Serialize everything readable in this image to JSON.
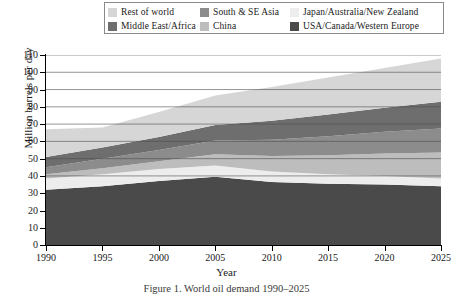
{
  "legend": {
    "entries": [
      {
        "label": "Rest of world",
        "color": "#d6d6d6",
        "row": 0,
        "col": 0
      },
      {
        "label": "South & SE Asia",
        "color": "#8c8c8c",
        "row": 0,
        "col": 1
      },
      {
        "label": "Japan/Australia/New Zealand",
        "color": "#ededed",
        "row": 0,
        "col": 2
      },
      {
        "label": "Middle East/Africa",
        "color": "#6e6e6e",
        "row": 1,
        "col": 0
      },
      {
        "label": "China",
        "color": "#bdbdbd",
        "row": 1,
        "col": 1
      },
      {
        "label": "USA/Canada/Western Europe",
        "color": "#4a4a4a",
        "row": 1,
        "col": 2
      }
    ]
  },
  "axes": {
    "y_title": "Million barrels per day",
    "x_title": "Year",
    "y_ticks": [
      "0",
      "10",
      "20",
      "30",
      "40",
      "50",
      "60",
      "70",
      "80",
      "90",
      "100",
      "110"
    ],
    "x_ticks": [
      "1990",
      "1995",
      "2000",
      "2005",
      "2010",
      "2015",
      "2020",
      "2025"
    ]
  },
  "caption": "Figure 1. World oil demand 1990–2025",
  "chart_data": {
    "type": "area",
    "title": "",
    "xlabel": "Year",
    "ylabel": "Million barrels per day",
    "xlim": [
      1990,
      2025
    ],
    "ylim": [
      0,
      110
    ],
    "ytick_step": 10,
    "grid": true,
    "grid_axis": "y",
    "legend_position": "top",
    "stacked": true,
    "stack_order_bottom_to_top": [
      "USA/Canada/Western Europe",
      "Japan/Australia/New Zealand",
      "China",
      "South & SE Asia",
      "Middle East/Africa",
      "Rest of world"
    ],
    "x": [
      1990,
      1995,
      2000,
      2005,
      2010,
      2015,
      2020,
      2025
    ],
    "series": [
      {
        "name": "USA/Canada/Western Europe",
        "color": "#4a4a4a",
        "values": [
          32.0,
          34.0,
          37.0,
          39.5,
          36.5,
          35.5,
          35.0,
          34.0
        ]
      },
      {
        "name": "Japan/Australia/New Zealand",
        "color": "#ededed",
        "values": [
          6.5,
          7.0,
          7.0,
          6.5,
          6.0,
          5.5,
          5.0,
          4.5
        ]
      },
      {
        "name": "China",
        "color": "#bdbdbd",
        "values": [
          2.5,
          3.5,
          4.5,
          6.5,
          9.0,
          11.0,
          13.0,
          15.0
        ]
      },
      {
        "name": "South & SE Asia",
        "color": "#8c8c8c",
        "values": [
          4.0,
          5.5,
          6.5,
          8.0,
          9.5,
          11.0,
          12.5,
          14.0
        ]
      },
      {
        "name": "Middle East/Africa",
        "color": "#6e6e6e",
        "values": [
          6.0,
          6.5,
          7.5,
          9.0,
          11.0,
          12.5,
          14.0,
          15.5
        ]
      },
      {
        "name": "Rest of world",
        "color": "#d6d6d6",
        "values": [
          16.0,
          11.5,
          14.5,
          17.0,
          19.5,
          21.5,
          23.0,
          25.0
        ]
      }
    ],
    "totals": [
      67.0,
      68.0,
      77.0,
      86.5,
      91.5,
      97.0,
      102.5,
      108.0
    ]
  }
}
